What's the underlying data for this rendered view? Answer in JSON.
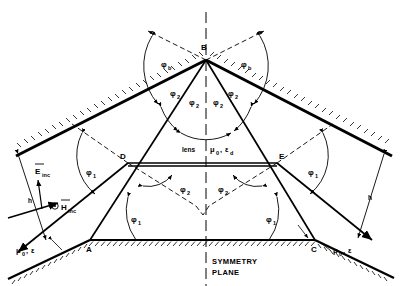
{
  "figure": {
    "background": "#ffffff",
    "ink": "#000000"
  },
  "points": {
    "b": "B",
    "d": "D",
    "e": "E",
    "a": "A",
    "c": "C"
  },
  "angles": {
    "phi_b_left": "φ",
    "phi_b_left_sub": "b",
    "phi_b_right": "φ",
    "phi_b_right_sub": "b",
    "phi2_b_left": "φ",
    "phi2_b_left_sub": "2",
    "phi2_b_inner_left": "φ",
    "phi2_b_inner_left_sub": "2",
    "phi2_b_inner_right": "φ",
    "phi2_b_inner_right_sub": "2",
    "phi2_b_right": "φ",
    "phi2_b_right_sub": "2",
    "phi1_d_outer": "φ",
    "phi1_d_outer_sub": "1",
    "phi1_e_outer": "φ",
    "phi1_e_outer_sub": "1",
    "phi2_d_inner": "φ",
    "phi2_d_inner_sub": "2",
    "phi2_e_inner": "φ",
    "phi2_e_inner_sub": "2",
    "phi1_a": "φ",
    "phi1_a_sub": "1",
    "phi1_c": "φ",
    "phi1_c_sub": "1"
  },
  "materials": {
    "lens_word": "lens",
    "lens_mu": "μ",
    "lens_mu_sub": "0",
    "lens_eps_sep": ",",
    "lens_eps": "ε",
    "lens_eps_sub": "d",
    "left_mu": "μ",
    "left_mu_sub": "0",
    "left_sep": ",",
    "left_eps": "ε",
    "right_mu": "μ",
    "right_mu_sub": "0",
    "right_sep": ",",
    "right_eps": "ε"
  },
  "fields": {
    "e_inc": "E",
    "e_inc_sub": "inc",
    "h_inc": "H",
    "h_inc_sub": "inc",
    "h_left": "h",
    "h_right": "h"
  },
  "symmetry": {
    "line1": "SYMMETRY",
    "line2": "PLANE"
  },
  "geometry": {
    "apex_b": [
      206,
      60
    ],
    "point_d": [
      128,
      163
    ],
    "point_e": [
      277,
      163
    ],
    "point_a": [
      90,
      240
    ],
    "point_c": [
      315,
      240
    ],
    "axis_x": 206
  }
}
